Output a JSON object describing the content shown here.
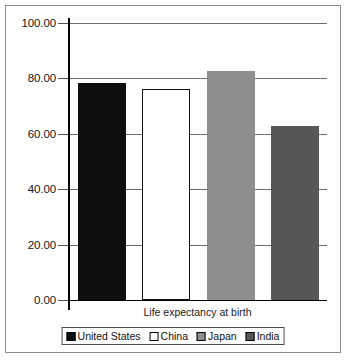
{
  "chart_data": {
    "type": "bar",
    "title": "",
    "subtitle": "",
    "xlabel": "Life expectancy at birth",
    "ylabel": "",
    "categories": [
      "Life expectancy at birth"
    ],
    "ylim": [
      0,
      100
    ],
    "yticks": [
      "0.00",
      "20.00",
      "40.00",
      "60.00",
      "80.00",
      "100.00"
    ],
    "ytick_values": [
      0,
      20,
      40,
      60,
      80,
      100
    ],
    "grid": true,
    "legend_position": "bottom",
    "series": [
      {
        "name": "United States",
        "values": [
          78.5
        ],
        "color": "#100f0f"
      },
      {
        "name": "China",
        "values": [
          76.0
        ],
        "color": "#ffffff"
      },
      {
        "name": "Japan",
        "values": [
          82.5
        ],
        "color": "#8e8e8e"
      },
      {
        "name": "India",
        "values": [
          63.0
        ],
        "color": "#575757"
      }
    ]
  },
  "figure": {
    "frame_color": "#8a8a8a",
    "grid_color": "#6e6e6e",
    "axis_color": "#000000",
    "background": "#ffffff"
  },
  "legend": {
    "entries": [
      {
        "label": "United States",
        "color": "#100f0f"
      },
      {
        "label": "China",
        "color": "#ffffff"
      },
      {
        "label": "Japan",
        "color": "#8e8e8e"
      },
      {
        "label": "India",
        "color": "#575757"
      }
    ]
  }
}
